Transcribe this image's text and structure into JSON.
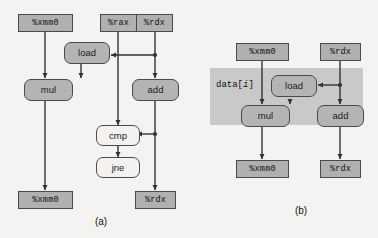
{
  "figure": {
    "background_color": "#f4f3f1",
    "node_fill": "#b0b0b0",
    "op_fill": "#b4b4b4",
    "op_light_fill": "#f3f2f0",
    "shade_fill": "#c9c9c9",
    "line_color": "#333333"
  },
  "panel_a": {
    "caption": "(a)",
    "registers_top": {
      "xmm0": "%xmm0",
      "rax": "%rax",
      "rdx": "%rdx"
    },
    "operations": {
      "load": "load",
      "mul": "mul",
      "add": "add",
      "cmp": "cmp",
      "jne": "jne"
    },
    "registers_bottom": {
      "xmm0": "%xmm0",
      "rdx": "%rdx"
    }
  },
  "panel_b": {
    "caption": "(b)",
    "shaded_label_prefix": "data[",
    "shaded_label_index": "i",
    "shaded_label_suffix": "]",
    "registers_top": {
      "xmm0": "%xmm0",
      "rdx": "%rdx"
    },
    "operations": {
      "load": "load",
      "mul": "mul",
      "add": "add"
    },
    "registers_bottom": {
      "xmm0": "%xmm0",
      "rdx": "%rdx"
    }
  }
}
